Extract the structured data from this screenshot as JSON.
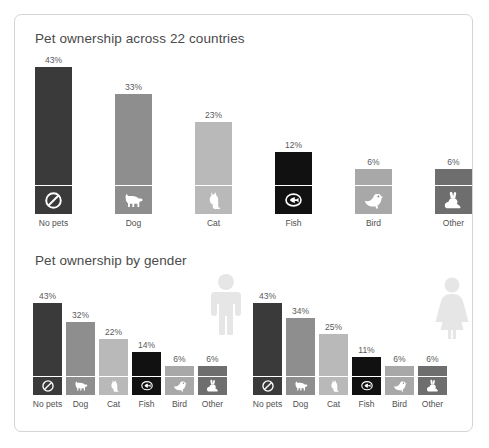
{
  "card": {
    "border_color": "#d4d4d4",
    "background": "#ffffff"
  },
  "palette": {
    "no_pets": "#3a3a3a",
    "dog": "#8e8e8e",
    "cat": "#b9b9b9",
    "fish": "#111111",
    "bird": "#a8a8a8",
    "other": "#6e6e6e",
    "label_text": "#4f4f4f",
    "title_text": "#4a4a4a",
    "figure_gray": "#e6e6e6"
  },
  "panels": {
    "top": {
      "title": "Pet ownership across 22 countries"
    },
    "bottom": {
      "title": "Pet ownership by gender"
    }
  },
  "icons": {
    "no_pets": "no-pets-icon",
    "dog": "dog-icon",
    "cat": "cat-icon",
    "fish": "fish-icon",
    "bird": "bird-icon",
    "other": "rabbit-icon",
    "male": "male-figure-icon",
    "female": "female-figure-icon"
  },
  "chart_data": [
    {
      "type": "bar",
      "title": "Pet ownership across 22 countries",
      "xlabel": "",
      "ylabel": "",
      "ylim": [
        0,
        43
      ],
      "grid": false,
      "legend": "none",
      "categories": [
        "No pets",
        "Dog",
        "Cat",
        "Fish",
        "Bird",
        "Other"
      ],
      "values": [
        43,
        33,
        23,
        12,
        6,
        6
      ],
      "value_labels": [
        "43%",
        "33%",
        "23%",
        "12%",
        "6%",
        "6%"
      ],
      "colors": [
        "#3a3a3a",
        "#8e8e8e",
        "#b9b9b9",
        "#111111",
        "#a8a8a8",
        "#6e6e6e"
      ]
    },
    {
      "type": "bar",
      "title": "Pet ownership by gender",
      "xlabel": "",
      "ylabel": "",
      "ylim": [
        0,
        43
      ],
      "grid": false,
      "legend": "none",
      "series_label": "Male",
      "categories": [
        "No pets",
        "Dog",
        "Cat",
        "Fish",
        "Bird",
        "Other"
      ],
      "values": [
        43,
        32,
        22,
        14,
        6,
        6
      ],
      "value_labels": [
        "43%",
        "32%",
        "22%",
        "14%",
        "6%",
        "6%"
      ],
      "colors": [
        "#3a3a3a",
        "#8e8e8e",
        "#b9b9b9",
        "#111111",
        "#a8a8a8",
        "#6e6e6e"
      ]
    },
    {
      "type": "bar",
      "title": "Pet ownership by gender",
      "xlabel": "",
      "ylabel": "",
      "ylim": [
        0,
        43
      ],
      "grid": false,
      "legend": "none",
      "series_label": "Female",
      "categories": [
        "No pets",
        "Dog",
        "Cat",
        "Fish",
        "Bird",
        "Other"
      ],
      "values": [
        43,
        34,
        25,
        11,
        6,
        6
      ],
      "value_labels": [
        "43%",
        "34%",
        "25%",
        "11%",
        "6%",
        "6%"
      ],
      "colors": [
        "#3a3a3a",
        "#8e8e8e",
        "#b9b9b9",
        "#111111",
        "#a8a8a8",
        "#6e6e6e"
      ]
    }
  ]
}
